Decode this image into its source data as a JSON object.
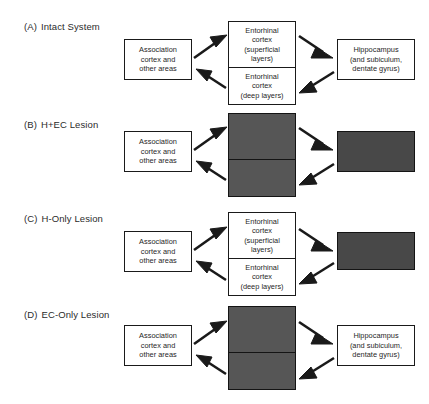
{
  "figure": {
    "background_color": "#ffffff",
    "line_color": "#1a1a1a",
    "lesion_color": "#565656",
    "lesion_dark_color": "#484848"
  },
  "node_text": {
    "association": "Association\ncortex and\nother areas",
    "ec_superficial": "Entorhinal\ncortex\n(superficial\nlayers)",
    "ec_deep": "Entorhinal\ncortex\n(deep layers)",
    "hippocampus": "Hippocampus\n(and subiculum,\ndentate gyrus)"
  },
  "panels": [
    {
      "id": "A",
      "tag": "(A)",
      "label": "Intact System",
      "nodes": {
        "association": {
          "state": "normal"
        },
        "ec_superficial": {
          "state": "normal"
        },
        "ec_deep": {
          "state": "normal"
        },
        "hippocampus": {
          "state": "normal"
        }
      }
    },
    {
      "id": "B",
      "tag": "(B)",
      "label": "H+EC Lesion",
      "nodes": {
        "association": {
          "state": "normal"
        },
        "ec_superficial": {
          "state": "lesion"
        },
        "ec_deep": {
          "state": "lesion"
        },
        "hippocampus": {
          "state": "lesion"
        }
      }
    },
    {
      "id": "C",
      "tag": "(C)",
      "label": "H-Only Lesion",
      "nodes": {
        "association": {
          "state": "normal"
        },
        "ec_superficial": {
          "state": "normal"
        },
        "ec_deep": {
          "state": "normal"
        },
        "hippocampus": {
          "state": "lesion"
        }
      }
    },
    {
      "id": "D",
      "tag": "(D)",
      "label": "EC-Only Lesion",
      "nodes": {
        "association": {
          "state": "normal"
        },
        "ec_superficial": {
          "state": "lesion"
        },
        "ec_deep": {
          "state": "lesion"
        },
        "hippocampus": {
          "state": "normal"
        }
      }
    }
  ],
  "connections": [
    {
      "from": "association",
      "to": "ec_superficial",
      "direction": "forward"
    },
    {
      "from": "ec_superficial",
      "to": "hippocampus",
      "direction": "forward"
    },
    {
      "from": "hippocampus",
      "to": "ec_deep",
      "direction": "forward"
    },
    {
      "from": "ec_deep",
      "to": "association",
      "direction": "forward"
    }
  ]
}
